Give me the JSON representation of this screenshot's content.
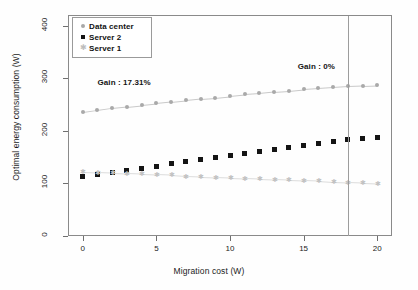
{
  "chart_data": {
    "type": "scatter",
    "title": "",
    "xlabel": "Migration cost (W)",
    "ylabel": "Optimal energy consumption (W)",
    "xlim": [
      -1,
      21
    ],
    "ylim": [
      0,
      420
    ],
    "xticks": [
      0,
      5,
      10,
      15,
      20
    ],
    "yticks": [
      0,
      100,
      200,
      300,
      400
    ],
    "grid": false,
    "legend_position": "top-left",
    "x": [
      0,
      1,
      2,
      3,
      4,
      5,
      6,
      7,
      8,
      9,
      10,
      11,
      12,
      13,
      14,
      15,
      16,
      17,
      18,
      19,
      20
    ],
    "series": [
      {
        "name": "Data center",
        "marker": "circle",
        "color": "#a9a9a9",
        "linestyle": "dotted",
        "values": [
          235,
          239,
          243,
          246,
          249,
          252,
          255,
          258,
          261,
          263,
          266,
          269,
          271,
          274,
          276,
          279,
          281,
          283,
          285,
          286,
          287
        ]
      },
      {
        "name": "Server 2",
        "marker": "square",
        "color": "#141414",
        "linestyle": "none",
        "values": [
          113,
          117,
          121,
          125,
          129,
          133,
          137,
          141,
          145,
          149,
          153,
          157,
          161,
          165,
          169,
          172,
          176,
          180,
          183,
          186,
          187
        ]
      },
      {
        "name": "Server 1",
        "marker": "cross",
        "color": "#c2c2c2",
        "linestyle": "dotted",
        "values": [
          122,
          121,
          120,
          119,
          118,
          117,
          116,
          114,
          113,
          112,
          111,
          110,
          109,
          108,
          107,
          106,
          105,
          103,
          102,
          101,
          100
        ]
      }
    ],
    "annotations": [
      {
        "text": "Gain : 17.31%",
        "x": 1.0,
        "y": 300,
        "name": "gain-left"
      },
      {
        "text": "Gain : 0%",
        "x": 14.6,
        "y": 330,
        "name": "gain-right"
      }
    ],
    "reference_lines": [
      {
        "orientation": "vertical",
        "x": 18,
        "color": "#9d9d9d"
      }
    ]
  },
  "legend": {
    "items": [
      {
        "label": "Data center",
        "marker": "circle-icon"
      },
      {
        "label": "Server 2",
        "marker": "square-icon"
      },
      {
        "label": "Server 1",
        "marker": "cross-icon"
      }
    ]
  },
  "axes": {
    "ylabel": "Optimal energy consumption (W)",
    "xlabel": "Migration cost (W)",
    "ytick_labels": [
      "0",
      "100",
      "200",
      "300",
      "400"
    ],
    "xtick_labels": [
      "0",
      "5",
      "10",
      "15",
      "20"
    ]
  },
  "annotations": {
    "gain_left": "Gain : 17.31%",
    "gain_right": "Gain : 0%"
  },
  "colors": {
    "data_center": "#a9a9a9",
    "server_2": "#141414",
    "server_1": "#c2c2c2",
    "axis": "#8a8a8a",
    "text": "#1b1b1b",
    "reference_line": "#9d9d9d",
    "background": "#fefefe"
  }
}
